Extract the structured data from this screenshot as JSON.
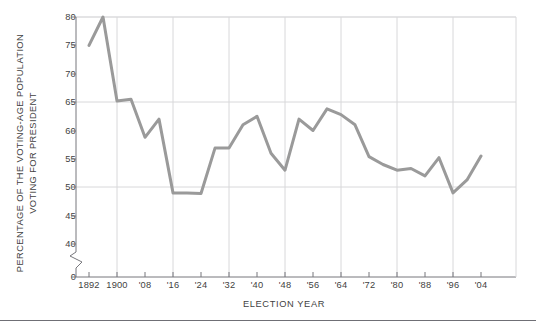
{
  "chart_data": {
    "type": "line",
    "title": "",
    "xlabel": "ELECTION YEAR",
    "ylabel": "PERCENTAGE OF THE VOTING-AGE POPULATION\nVOTING FOR PRESIDENT",
    "ylabel_line1": "PERCENTAGE OF THE VOTING-AGE POPULATION",
    "ylabel_line2": "VOTING FOR PRESIDENT",
    "ylim": [
      40,
      80
    ],
    "y_axis_break": true,
    "y_break_low_value": 0,
    "yticks": [
      "80",
      "75",
      "70",
      "65",
      "60",
      "55",
      "50",
      "45",
      "40",
      "0"
    ],
    "ytick_values": [
      80,
      75,
      70,
      65,
      60,
      55,
      50,
      45,
      40,
      0
    ],
    "gridlines_y": [
      80,
      65,
      50
    ],
    "gridlines_x": [
      1900,
      1916,
      1932,
      1948,
      1964,
      1980,
      1996
    ],
    "grid": true,
    "legend": "none",
    "xticks": [
      "1892",
      "1900",
      "'08",
      "'16",
      "'24",
      "'32",
      "'40",
      "'48",
      "'56",
      "'64",
      "'72",
      "'80",
      "'88",
      "'96",
      "'04"
    ],
    "xtick_values": [
      1892,
      1900,
      1908,
      1916,
      1924,
      1932,
      1940,
      1948,
      1956,
      1964,
      1972,
      1980,
      1988,
      1996,
      2004
    ],
    "xlim": [
      1890,
      2006
    ],
    "line_color": "#9a9a9a",
    "line_width": 3,
    "series": [
      {
        "name": "Voter turnout",
        "x": [
          1892,
          1896,
          1900,
          1904,
          1908,
          1912,
          1916,
          1920,
          1924,
          1928,
          1932,
          1936,
          1940,
          1944,
          1948,
          1952,
          1956,
          1960,
          1964,
          1968,
          1972,
          1976,
          1980,
          1984,
          1988,
          1992,
          1996,
          2000,
          2004
        ],
        "values": [
          75.0,
          80.0,
          65.2,
          65.5,
          58.8,
          62.0,
          49.0,
          49.0,
          48.9,
          56.9,
          56.9,
          61.0,
          62.5,
          56.0,
          53.0,
          62.0,
          60.0,
          63.8,
          62.8,
          61.0,
          55.4,
          54.0,
          53.0,
          53.3,
          52.0,
          55.2,
          49.0,
          51.3,
          55.5
        ]
      }
    ]
  },
  "axes": {
    "x_axis_title": "ELECTION YEAR"
  }
}
